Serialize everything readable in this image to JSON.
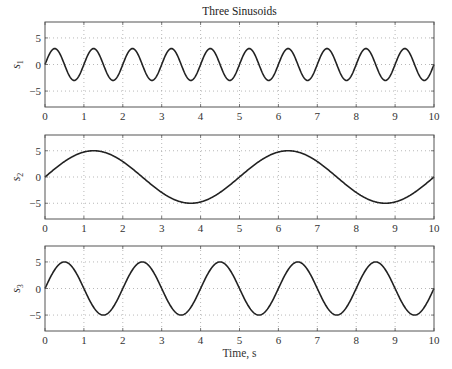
{
  "figure": {
    "title": "Three Sinusoids",
    "xlabel": "Time, s"
  },
  "chart_data": [
    {
      "type": "line",
      "panel": 1,
      "title": "Three Sinusoids",
      "ylabel": "s_1",
      "ylabel_base": "s",
      "ylabel_sub": "1",
      "xlabel": "",
      "xlim": [
        0,
        10
      ],
      "ylim": [
        -8,
        8
      ],
      "xticks": [
        0,
        1,
        2,
        3,
        4,
        5,
        6,
        7,
        8,
        9,
        10
      ],
      "yticks": [
        -5,
        0,
        5
      ],
      "grid": true,
      "series": [
        {
          "name": "s1",
          "formula": "3*sin(2*pi*t)",
          "amplitude": 3,
          "period": 1,
          "color": "#222222"
        }
      ]
    },
    {
      "type": "line",
      "panel": 2,
      "ylabel": "s_2",
      "ylabel_base": "s",
      "ylabel_sub": "2",
      "xlabel": "",
      "xlim": [
        0,
        10
      ],
      "ylim": [
        -8,
        8
      ],
      "xticks": [
        0,
        1,
        2,
        3,
        4,
        5,
        6,
        7,
        8,
        9,
        10
      ],
      "yticks": [
        -5,
        0,
        5
      ],
      "grid": true,
      "series": [
        {
          "name": "s2",
          "formula": "5*sin(2*pi*t/5)",
          "amplitude": 5,
          "period": 5,
          "color": "#222222"
        }
      ]
    },
    {
      "type": "line",
      "panel": 3,
      "ylabel": "s_3",
      "ylabel_base": "s",
      "ylabel_sub": "3",
      "xlabel": "Time, s",
      "xlim": [
        0,
        10
      ],
      "ylim": [
        -8,
        8
      ],
      "xticks": [
        0,
        1,
        2,
        3,
        4,
        5,
        6,
        7,
        8,
        9,
        10
      ],
      "yticks": [
        -5,
        0,
        5
      ],
      "grid": true,
      "series": [
        {
          "name": "s3",
          "formula": "5*sin(pi*t)",
          "amplitude": 5,
          "period": 2,
          "color": "#222222"
        }
      ]
    }
  ],
  "layout": {
    "panels": [
      {
        "left": 45,
        "right": 434,
        "top": 22,
        "bottom": 107
      },
      {
        "left": 45,
        "right": 434,
        "top": 135,
        "bottom": 219
      },
      {
        "left": 45,
        "right": 434,
        "top": 246,
        "bottom": 331
      }
    ],
    "colors": {
      "axis": "#555555",
      "grid": "#9a9a9a",
      "line": "#222222"
    }
  }
}
